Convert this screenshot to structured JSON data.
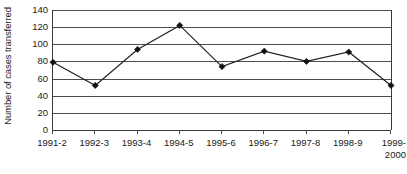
{
  "chart_data": {
    "type": "line",
    "title": "",
    "subtitle": "",
    "xlabel": "",
    "ylabel": "Number of cases transferred",
    "categories": [
      "1991-2",
      "1992-3",
      "1993-4",
      "1994-5",
      "1995-6",
      "1996-7",
      "1997-8",
      "1998-9",
      "1999-2000"
    ],
    "category_labels_display": [
      "1991-2",
      "1992-3",
      "1993-4",
      "1994-5",
      "1995-6",
      "1996-7",
      "1997-8",
      "1998-9",
      "1999-\n2000"
    ],
    "values": [
      79,
      52,
      94,
      122,
      74,
      92,
      80,
      91,
      52
    ],
    "series": [
      {
        "name": "Number of cases transferred",
        "values": [
          79,
          52,
          94,
          122,
          74,
          92,
          80,
          91,
          52
        ],
        "line_color": "#222222",
        "marker": "diamond",
        "marker_color": "#111111"
      }
    ],
    "ylim": [
      0,
      140
    ],
    "yticks": [
      0,
      20,
      40,
      60,
      80,
      100,
      120,
      140
    ],
    "ytick_labels": [
      "0",
      "20",
      "40",
      "60",
      "80",
      "100",
      "120",
      "140"
    ],
    "grid": "horizontal",
    "grid_color": "#4d4d4d",
    "legend": "none",
    "background_color": "#ffffff",
    "axis_color": "#3a3a3a",
    "annotations": []
  }
}
